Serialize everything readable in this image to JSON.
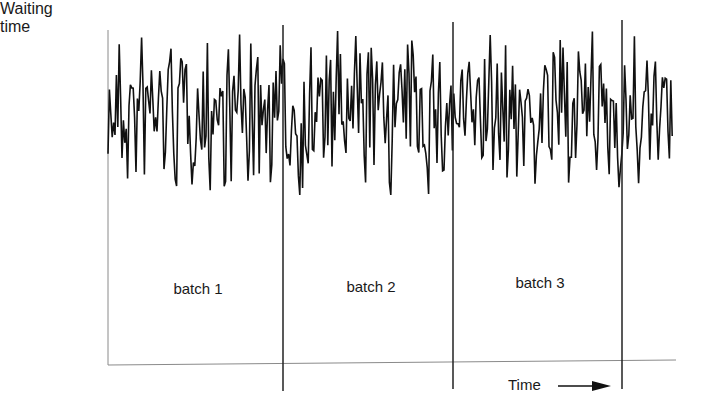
{
  "chart_data": {
    "type": "line",
    "title": "",
    "ylabel": "Waiting time",
    "xlabel": "Time",
    "batches": [
      "batch 1",
      "batch 2",
      "batch 3"
    ],
    "batch_boundaries_px": [
      283,
      453,
      621
    ],
    "series_band_px": {
      "top": 30,
      "bottom": 195,
      "mean": 112
    },
    "x_range_px": [
      108,
      673
    ],
    "grid": false,
    "legend": null,
    "axis_ticks": false
  },
  "labels": {
    "y_axis_line1": "Waiting",
    "y_axis_line2": "time",
    "x_axis": "Time",
    "batch1": "batch 1",
    "batch2": "batch 2",
    "batch3": "batch 3"
  },
  "colors": {
    "series": "#111111",
    "axis": "#888888",
    "divider": "#222222",
    "text": "#1a1a1a"
  }
}
